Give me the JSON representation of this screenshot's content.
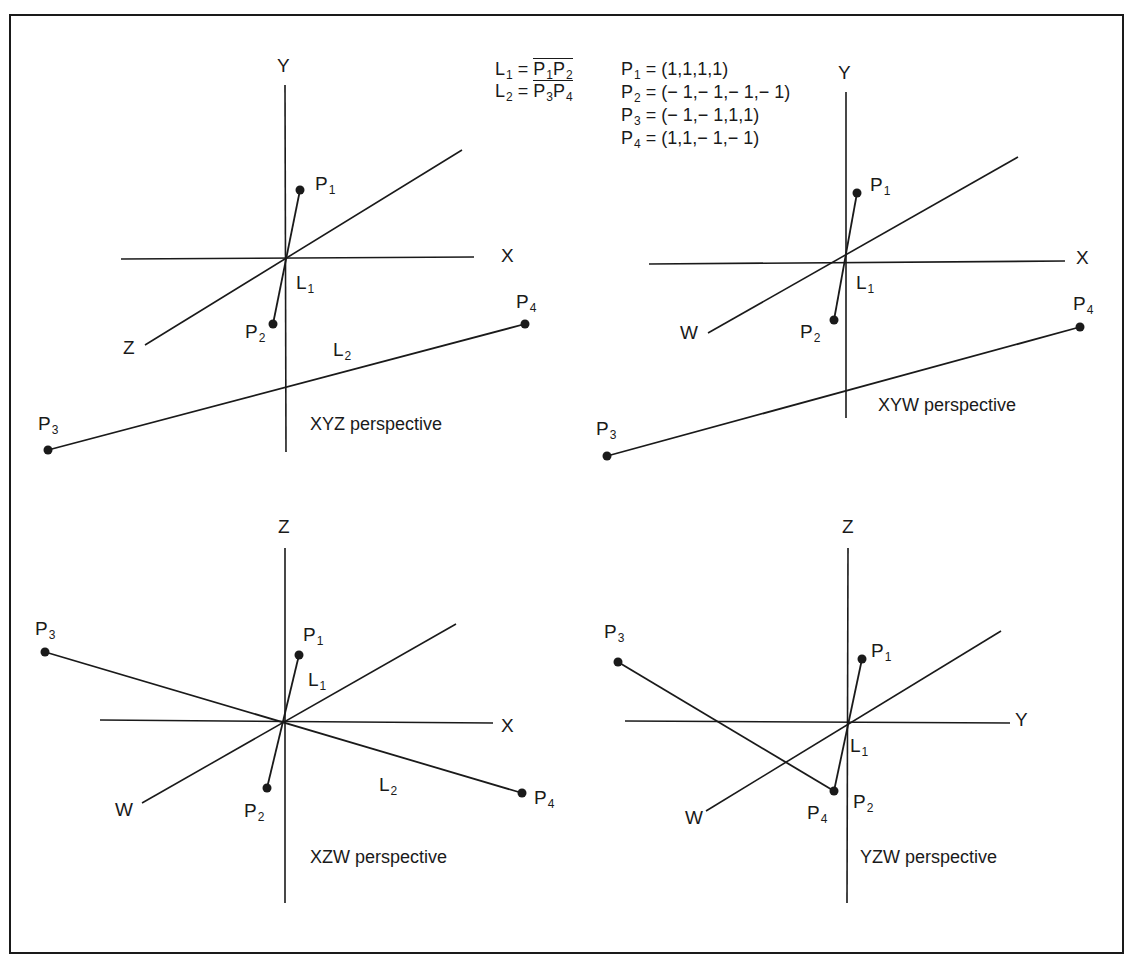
{
  "definitions": {
    "lines": [
      {
        "name": "L",
        "sub": "1",
        "from": "P",
        "from_sub": "1",
        "to": "P",
        "to_sub": "2"
      },
      {
        "name": "L",
        "sub": "2",
        "from": "P",
        "from_sub": "3",
        "to": "P",
        "to_sub": "4"
      }
    ],
    "points": [
      {
        "name": "P",
        "sub": "1",
        "value": "= (1,1,1,1)"
      },
      {
        "name": "P",
        "sub": "2",
        "value": "= (− 1,− 1,− 1,− 1)"
      },
      {
        "name": "P",
        "sub": "3",
        "value": "= (− 1,− 1,1,1)"
      },
      {
        "name": "P",
        "sub": "4",
        "value": "= (1,1,− 1,− 1)"
      }
    ],
    "eq": "="
  },
  "panels": [
    {
      "id": "xyz",
      "caption": "XYZ perspective",
      "caption_pos": [
        310,
        415
      ],
      "axes": [
        {
          "x1": 285,
          "y1": 85,
          "x2": 286,
          "y2": 452
        },
        {
          "x1": 121,
          "y1": 259,
          "x2": 474,
          "y2": 257
        },
        {
          "x1": 145,
          "y1": 345,
          "x2": 462,
          "y2": 150
        }
      ],
      "segments": [
        {
          "x1": 300,
          "y1": 190,
          "x2": 273,
          "y2": 324
        },
        {
          "x1": 48,
          "y1": 450,
          "x2": 525,
          "y2": 324
        }
      ],
      "points": [
        [
          300,
          190
        ],
        [
          273,
          324
        ],
        [
          48,
          450
        ],
        [
          525,
          324
        ]
      ],
      "labels": [
        {
          "t": "Y",
          "s": "",
          "x": 277,
          "y": 56
        },
        {
          "t": "X",
          "s": "",
          "x": 501,
          "y": 246
        },
        {
          "t": "Z",
          "s": "",
          "x": 123,
          "y": 338
        },
        {
          "t": "P",
          "s": "1",
          "x": 315,
          "y": 174
        },
        {
          "t": "L",
          "s": "1",
          "x": 296,
          "y": 273
        },
        {
          "t": "P",
          "s": "2",
          "x": 245,
          "y": 322
        },
        {
          "t": "L",
          "s": "2",
          "x": 333,
          "y": 340
        },
        {
          "t": "P",
          "s": "4",
          "x": 516,
          "y": 292
        },
        {
          "t": "P",
          "s": "3",
          "x": 38,
          "y": 414
        }
      ]
    },
    {
      "id": "xyw",
      "caption": "XYW perspective",
      "caption_pos": [
        878,
        396
      ],
      "axes": [
        {
          "x1": 846,
          "y1": 92,
          "x2": 846,
          "y2": 418
        },
        {
          "x1": 649,
          "y1": 264,
          "x2": 1065,
          "y2": 261
        },
        {
          "x1": 708,
          "y1": 333,
          "x2": 1018,
          "y2": 157
        }
      ],
      "segments": [
        {
          "x1": 857,
          "y1": 193,
          "x2": 834,
          "y2": 320
        },
        {
          "x1": 607,
          "y1": 456,
          "x2": 1080,
          "y2": 327
        }
      ],
      "points": [
        [
          857,
          193
        ],
        [
          834,
          320
        ],
        [
          607,
          456
        ],
        [
          1080,
          327
        ]
      ],
      "labels": [
        {
          "t": "Y",
          "s": "",
          "x": 838,
          "y": 63
        },
        {
          "t": "X",
          "s": "",
          "x": 1076,
          "y": 248
        },
        {
          "t": "W",
          "s": "",
          "x": 680,
          "y": 323
        },
        {
          "t": "P",
          "s": "1",
          "x": 870,
          "y": 175
        },
        {
          "t": "L",
          "s": "1",
          "x": 856,
          "y": 273
        },
        {
          "t": "P",
          "s": "2",
          "x": 800,
          "y": 322
        },
        {
          "t": "P",
          "s": "4",
          "x": 1073,
          "y": 294
        },
        {
          "t": "P",
          "s": "3",
          "x": 596,
          "y": 419
        }
      ]
    },
    {
      "id": "xzw",
      "caption": "XZW perspective",
      "caption_pos": [
        310,
        848
      ],
      "axes": [
        {
          "x1": 285,
          "y1": 548,
          "x2": 285,
          "y2": 903
        },
        {
          "x1": 100,
          "y1": 720,
          "x2": 493,
          "y2": 723
        },
        {
          "x1": 142,
          "y1": 803,
          "x2": 456,
          "y2": 624
        }
      ],
      "segments": [
        {
          "x1": 299,
          "y1": 655,
          "x2": 267,
          "y2": 788
        },
        {
          "x1": 45,
          "y1": 652,
          "x2": 522,
          "y2": 793
        }
      ],
      "points": [
        [
          299,
          655
        ],
        [
          267,
          788
        ],
        [
          45,
          652
        ],
        [
          522,
          793
        ]
      ],
      "labels": [
        {
          "t": "Z",
          "s": "",
          "x": 278,
          "y": 517
        },
        {
          "t": "X",
          "s": "",
          "x": 501,
          "y": 716
        },
        {
          "t": "W",
          "s": "",
          "x": 115,
          "y": 800
        },
        {
          "t": "P",
          "s": "1",
          "x": 303,
          "y": 625
        },
        {
          "t": "L",
          "s": "1",
          "x": 308,
          "y": 670
        },
        {
          "t": "P",
          "s": "2",
          "x": 244,
          "y": 801
        },
        {
          "t": "L",
          "s": "2",
          "x": 379,
          "y": 775
        },
        {
          "t": "P",
          "s": "4",
          "x": 534,
          "y": 788
        },
        {
          "t": "P",
          "s": "3",
          "x": 35,
          "y": 619
        }
      ]
    },
    {
      "id": "yzw",
      "caption": "YZW perspective",
      "caption_pos": [
        860,
        848
      ],
      "axes": [
        {
          "x1": 848,
          "y1": 548,
          "x2": 847,
          "y2": 903
        },
        {
          "x1": 625,
          "y1": 721,
          "x2": 1010,
          "y2": 723
        },
        {
          "x1": 706,
          "y1": 811,
          "x2": 1001,
          "y2": 631
        }
      ],
      "segments": [
        {
          "x1": 862,
          "y1": 659,
          "x2": 834,
          "y2": 791
        },
        {
          "x1": 618,
          "y1": 662,
          "x2": 834,
          "y2": 791
        }
      ],
      "points": [
        [
          862,
          659
        ],
        [
          834,
          791
        ],
        [
          618,
          662
        ]
      ],
      "labels": [
        {
          "t": "Z",
          "s": "",
          "x": 842,
          "y": 517
        },
        {
          "t": "Y",
          "s": "",
          "x": 1015,
          "y": 710
        },
        {
          "t": "W",
          "s": "",
          "x": 685,
          "y": 808
        },
        {
          "t": "P",
          "s": "1",
          "x": 871,
          "y": 641
        },
        {
          "t": "L",
          "s": "1",
          "x": 850,
          "y": 736
        },
        {
          "t": "P",
          "s": "4",
          "x": 807,
          "y": 803
        },
        {
          "t": "P",
          "s": "2",
          "x": 853,
          "y": 792
        },
        {
          "t": "P",
          "s": "3",
          "x": 604,
          "y": 622
        }
      ]
    }
  ],
  "colors": {
    "ink": "#1a1a1a",
    "background": "#ffffff"
  }
}
